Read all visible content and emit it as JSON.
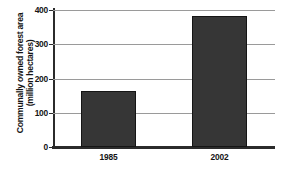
{
  "chart_data": {
    "type": "bar",
    "title": "",
    "xlabel": "",
    "ylabel_lines": [
      "Communally owned forest area",
      "(million hectares)"
    ],
    "ylabel": "Communally owned forest area (million hectares)",
    "categories": [
      "1985",
      "2002"
    ],
    "values": [
      165,
      382
    ],
    "ylim": [
      0,
      400
    ],
    "yticks": [
      0,
      100,
      200,
      300,
      400
    ],
    "ytick_labels": [
      "0",
      "100",
      "200",
      "300",
      "400"
    ],
    "grid": true,
    "legend": false,
    "bar_color": "#363636",
    "axis_color": "#2b2b2b",
    "grid_color": "#9a9a9a"
  }
}
